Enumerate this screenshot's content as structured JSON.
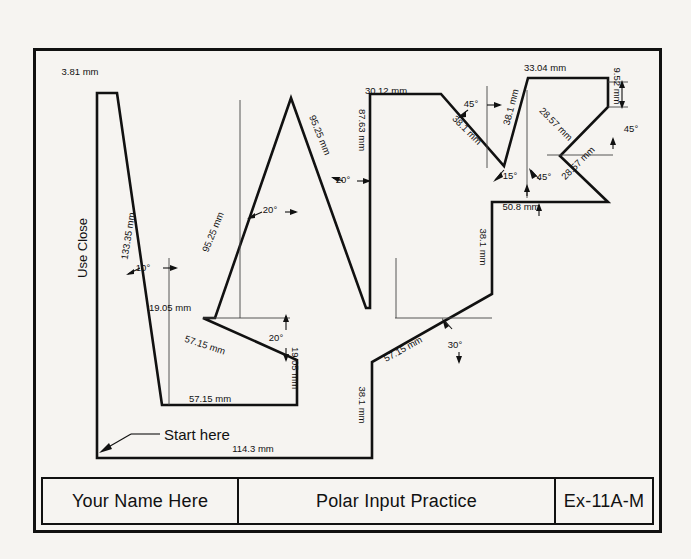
{
  "drawing": {
    "note_left": "Use Close",
    "start_note": "Start here",
    "dimensions": [
      {
        "id": "d-381",
        "text": "3.81 mm",
        "x": 80,
        "y": 72,
        "rot": 0
      },
      {
        "id": "d-13335",
        "text": "133.35 mm",
        "x": 128,
        "y": 236,
        "rot": -81
      },
      {
        "id": "a-10",
        "text": "10°",
        "x": 143,
        "y": 268,
        "rot": 0
      },
      {
        "id": "d-1905-a",
        "text": "19.05 mm",
        "x": 170,
        "y": 308,
        "rot": 0
      },
      {
        "id": "d-5715-a",
        "text": "57.15 mm",
        "x": 205,
        "y": 345,
        "rot": 18
      },
      {
        "id": "a-20-a",
        "text": "20°",
        "x": 276,
        "y": 338,
        "rot": 0
      },
      {
        "id": "d-1905-b",
        "text": "19.05 mm",
        "x": 295,
        "y": 368,
        "rot": 90
      },
      {
        "id": "d-5715-b",
        "text": "57.15 mm",
        "x": 210,
        "y": 399,
        "rot": 0
      },
      {
        "id": "d-1143",
        "text": "114.3 mm",
        "x": 253,
        "y": 449,
        "rot": 0
      },
      {
        "id": "d-9525-a",
        "text": "95.25 mm",
        "x": 213,
        "y": 232,
        "rot": -68
      },
      {
        "id": "a-20-b",
        "text": "20°",
        "x": 270,
        "y": 210,
        "rot": 0
      },
      {
        "id": "d-9525-b",
        "text": "95.25 mm",
        "x": 320,
        "y": 135,
        "rot": 68
      },
      {
        "id": "a-20-c",
        "text": "20°",
        "x": 343,
        "y": 180,
        "rot": 0
      },
      {
        "id": "d-8763",
        "text": "87.63 mm",
        "x": 362,
        "y": 130,
        "rot": 90
      },
      {
        "id": "d-3012",
        "text": "30.12 mm",
        "x": 386,
        "y": 91,
        "rot": 0
      },
      {
        "id": "a-45-a",
        "text": "45°",
        "x": 471,
        "y": 104,
        "rot": 0
      },
      {
        "id": "d-381-a",
        "text": "38.1 mm",
        "x": 467,
        "y": 130,
        "rot": 45
      },
      {
        "id": "d-381-b",
        "text": "38.1 mm",
        "x": 511,
        "y": 107,
        "rot": -75
      },
      {
        "id": "a-15",
        "text": "15°",
        "x": 510,
        "y": 176,
        "rot": 0
      },
      {
        "id": "a-45-b",
        "text": "45°",
        "x": 544,
        "y": 177,
        "rot": 0
      },
      {
        "id": "d-508",
        "text": "50.8 mm",
        "x": 521,
        "y": 207,
        "rot": 0
      },
      {
        "id": "d-3304",
        "text": "33.04 mm",
        "x": 545,
        "y": 68,
        "rot": 0
      },
      {
        "id": "d-952",
        "text": "9.52 mm",
        "x": 617,
        "y": 86,
        "rot": 90
      },
      {
        "id": "d-2857-a",
        "text": "28.57 mm",
        "x": 556,
        "y": 124,
        "rot": 45
      },
      {
        "id": "a-45-c",
        "text": "45°",
        "x": 631,
        "y": 129,
        "rot": 0
      },
      {
        "id": "d-2857-b",
        "text": "28.57 mm",
        "x": 578,
        "y": 163,
        "rot": -45
      },
      {
        "id": "d-381-c",
        "text": "38.1 mm",
        "x": 483,
        "y": 247,
        "rot": 90
      },
      {
        "id": "d-5715-c",
        "text": "57.15 mm",
        "x": 403,
        "y": 349,
        "rot": -29
      },
      {
        "id": "a-30",
        "text": "30°",
        "x": 455,
        "y": 345,
        "rot": 0
      },
      {
        "id": "d-381-d",
        "text": "38.1 mm",
        "x": 362,
        "y": 405,
        "rot": 90
      }
    ]
  },
  "title_block": {
    "name": "Your Name Here",
    "title": "Polar Input Practice",
    "code": "Ex-11A-M"
  },
  "colors": {
    "ink": "#111111",
    "paper": "#f6f4f1",
    "thin": "#5a5a5a"
  }
}
